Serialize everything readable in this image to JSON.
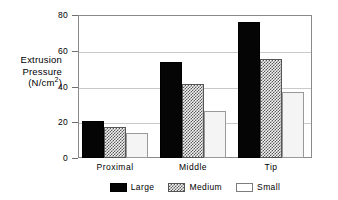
{
  "chart_data": {
    "type": "bar",
    "title": "",
    "xlabel": "",
    "ylabel": "Extrusion Pressure (N/cm2)",
    "ylabel_lines": [
      "Extrusion",
      "Pressure",
      "(N/cm",
      ")"
    ],
    "ylabel_superscript": "2",
    "categories": [
      "Proximal",
      "Middle",
      "Tip"
    ],
    "series": [
      {
        "name": "Large",
        "values": [
          20.5,
          53.5,
          76.0
        ],
        "color": "#050505",
        "fill": "solid"
      },
      {
        "name": "Medium",
        "values": [
          17.5,
          41.5,
          55.5
        ],
        "color": "#5a5a5a",
        "fill": "checkered"
      },
      {
        "name": "Small",
        "values": [
          14.0,
          26.5,
          37.0
        ],
        "color": "#f4f4f4",
        "fill": "empty"
      }
    ],
    "ylim": [
      0,
      80
    ],
    "yticks": [
      0,
      20,
      40,
      60,
      80
    ],
    "ytick_labels": [
      "0",
      "20",
      "40",
      "60",
      "80"
    ],
    "grid": true,
    "grid_axis": "y",
    "legend_position": "bottom",
    "legend_entries": [
      "Large",
      "Medium",
      "Small"
    ]
  },
  "axis": {
    "y_title_line1": "Extrusion",
    "y_title_line2": "Pressure",
    "y_title_line3_prefix": "(N/cm",
    "y_title_superscript": "2",
    "y_title_line3_suffix": ")"
  },
  "yticks": [
    {
      "label": "80",
      "value": 80
    },
    {
      "label": "60",
      "value": 60
    },
    {
      "label": "40",
      "value": 40
    },
    {
      "label": "20",
      "value": 20
    },
    {
      "label": "0",
      "value": 0
    }
  ],
  "groups": [
    {
      "label": "Proximal",
      "bars": [
        {
          "series": "Large",
          "value": 20.5
        },
        {
          "series": "Medium",
          "value": 17.5
        },
        {
          "series": "Small",
          "value": 14.0
        }
      ]
    },
    {
      "label": "Middle",
      "bars": [
        {
          "series": "Large",
          "value": 53.5
        },
        {
          "series": "Medium",
          "value": 41.5
        },
        {
          "series": "Small",
          "value": 26.5
        }
      ]
    },
    {
      "label": "Tip",
      "bars": [
        {
          "series": "Large",
          "value": 76.0
        },
        {
          "series": "Medium",
          "value": 55.5
        },
        {
          "series": "Small",
          "value": 37.0
        }
      ]
    }
  ],
  "legend": [
    {
      "label": "Large",
      "style": "large"
    },
    {
      "label": "Medium",
      "style": "medium"
    },
    {
      "label": "Small",
      "style": "small"
    }
  ]
}
